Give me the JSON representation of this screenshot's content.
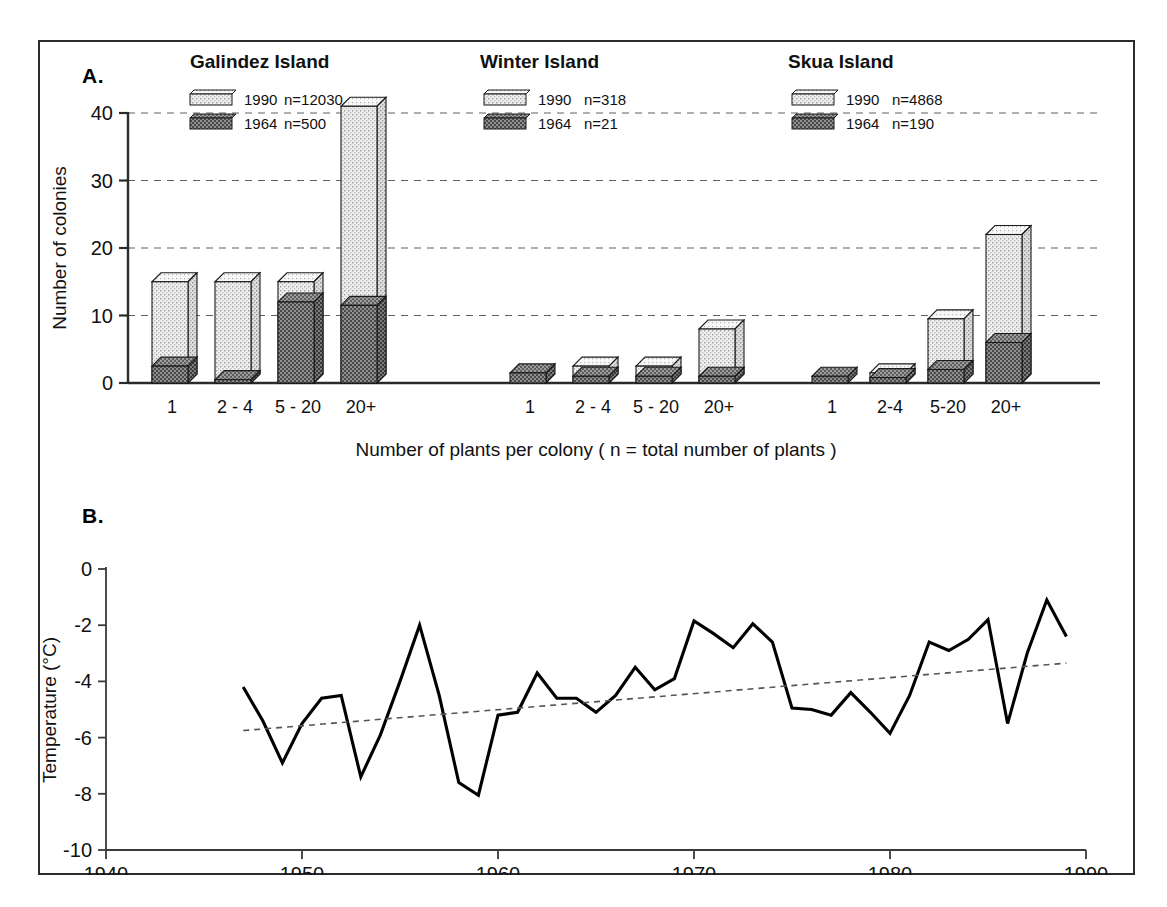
{
  "figure": {
    "panel_a_letter": "A.",
    "panel_b_letter": "B."
  },
  "chart_data": [
    {
      "type": "bar",
      "id": "panel-a",
      "title": "",
      "xlabel": "Number of plants per colony  ( n = total number of plants )",
      "ylabel": "Number of colonies",
      "ylim": [
        0,
        42
      ],
      "yticks": [
        0,
        10,
        20,
        30,
        40
      ],
      "ytick_labels": [
        "0",
        "10",
        "20",
        "30",
        "40"
      ],
      "grid": "horizontal-dashed",
      "stacked": false,
      "overlay_note": "Each category draws a light 1990 bar with a darker 1964 bar overlaid at its base",
      "legend_position": "inside-top-left-of-each-group",
      "series_colors": {
        "1990": "#e8e8e8",
        "1964": "#6f6f6f"
      },
      "groups": [
        {
          "name": "Galindez Island",
          "legend": [
            {
              "label": "1990",
              "n_text": "n=12030",
              "n": 12030
            },
            {
              "label": "1964",
              "n_text": "n=500",
              "n": 500
            }
          ],
          "categories": [
            "1",
            "2 - 4",
            "5 - 20",
            "20+"
          ],
          "series": [
            {
              "name": "1990",
              "values": [
                15,
                15,
                15,
                41
              ]
            },
            {
              "name": "1964",
              "values": [
                2.5,
                0.5,
                12,
                11.5
              ]
            }
          ]
        },
        {
          "name": "Winter Island",
          "legend": [
            {
              "label": "1990",
              "n_text": "n=318",
              "n": 318
            },
            {
              "label": "1964",
              "n_text": "n=21",
              "n": 21
            }
          ],
          "categories": [
            "1",
            "2 - 4",
            "5 - 20",
            "20+"
          ],
          "series": [
            {
              "name": "1990",
              "values": [
                0,
                2.5,
                2.5,
                8
              ]
            },
            {
              "name": "1964",
              "values": [
                1.5,
                1,
                1,
                1
              ]
            }
          ]
        },
        {
          "name": "Skua Island",
          "legend": [
            {
              "label": "1990",
              "n_text": "n=4868",
              "n": 4868
            },
            {
              "label": "1964",
              "n_text": "n=190",
              "n": 190
            }
          ],
          "categories": [
            "1",
            "2-4",
            "5-20",
            "20+"
          ],
          "series": [
            {
              "name": "1990",
              "values": [
                0,
                1.5,
                9.5,
                22
              ]
            },
            {
              "name": "1964",
              "values": [
                1,
                0.8,
                2,
                6
              ]
            }
          ]
        }
      ]
    },
    {
      "type": "line",
      "id": "panel-b",
      "title": "",
      "xlabel": "Year",
      "ylabel": "Temperature (°C)",
      "xlim": [
        1940,
        1990
      ],
      "ylim": [
        -10,
        0
      ],
      "xticks": [
        1940,
        1950,
        1960,
        1970,
        1980,
        1990
      ],
      "xtick_labels": [
        "1940",
        "1950",
        "1960",
        "1970",
        "1980",
        "1990"
      ],
      "yticks": [
        0,
        -2,
        -4,
        -6,
        -8,
        -10
      ],
      "ytick_labels": [
        "0",
        "-2",
        "-4",
        "-6",
        "-8",
        "-10"
      ],
      "grid": "none",
      "legend_position": "none",
      "series": [
        {
          "name": "Mean annual temperature",
          "style": "solid",
          "color": "#000000",
          "x": [
            1947,
            1948,
            1949,
            1950,
            1951,
            1952,
            1953,
            1954,
            1955,
            1956,
            1957,
            1958,
            1959,
            1960,
            1961,
            1962,
            1963,
            1964,
            1965,
            1966,
            1967,
            1968,
            1969,
            1970,
            1971,
            1972,
            1973,
            1974,
            1975,
            1976,
            1977,
            1978,
            1979,
            1980,
            1981,
            1982,
            1983,
            1984,
            1985,
            1986,
            1987,
            1988,
            1989
          ],
          "values": [
            -4.2,
            -5.4,
            -6.9,
            -5.5,
            -4.6,
            -4.5,
            -7.4,
            -5.9,
            -4.0,
            -2.0,
            -4.5,
            -7.6,
            -8.05,
            -5.2,
            -5.1,
            -3.7,
            -4.6,
            -4.6,
            -5.1,
            -4.5,
            -3.5,
            -4.3,
            -3.9,
            -1.85,
            -2.3,
            -2.8,
            -1.95,
            -2.6,
            -4.95,
            -5.0,
            -5.2,
            -4.4,
            -5.1,
            -5.85,
            -4.5,
            -2.6,
            -2.9,
            -2.5,
            -1.8,
            -5.5,
            -3.0,
            -1.1,
            -2.4
          ]
        },
        {
          "name": "Linear trend",
          "style": "dashed",
          "color": "#555555",
          "x": [
            1947,
            1989
          ],
          "values": [
            -5.75,
            -3.35
          ]
        }
      ]
    }
  ]
}
